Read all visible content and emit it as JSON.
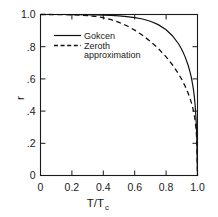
{
  "chart_data": {
    "type": "line",
    "title": "",
    "xlabel": "T/Tc",
    "xlabel_main": "T/T",
    "xlabel_sub": "c",
    "ylabel": "r",
    "xlim": [
      0,
      1.0
    ],
    "ylim": [
      0,
      1.0
    ],
    "grid": false,
    "legend_position": "upper-left-inside",
    "xticks": [
      0,
      0.2,
      0.4,
      0.6,
      0.8,
      1.0
    ],
    "xtick_labels": [
      "0",
      "0.2",
      "0.4",
      "0.6",
      "0.8",
      "1.0"
    ],
    "yticks": [
      0,
      0.2,
      0.4,
      0.6,
      0.8,
      1.0
    ],
    "ytick_labels": [
      "0",
      ".2",
      ".4",
      ".6",
      ".8",
      "1.0"
    ],
    "series": [
      {
        "name": "Gokcen",
        "style": "solid",
        "color": "#111111",
        "x": [
          0.0,
          0.05,
          0.1,
          0.15,
          0.2,
          0.25,
          0.3,
          0.35,
          0.4,
          0.45,
          0.5,
          0.55,
          0.6,
          0.65,
          0.7,
          0.75,
          0.8,
          0.84,
          0.88,
          0.9,
          0.92,
          0.94,
          0.95,
          0.96,
          0.97,
          0.975,
          0.98,
          0.985,
          0.99,
          0.995,
          1.0
        ],
        "values": [
          1.0,
          1.0,
          1.0,
          1.0,
          0.999,
          0.999,
          0.998,
          0.997,
          0.996,
          0.994,
          0.991,
          0.987,
          0.981,
          0.972,
          0.958,
          0.937,
          0.905,
          0.868,
          0.817,
          0.783,
          0.74,
          0.686,
          0.652,
          0.612,
          0.56,
          0.528,
          0.488,
          0.436,
          0.364,
          0.255,
          0.0
        ]
      },
      {
        "name": "Zeroth approximation",
        "style": "dashed",
        "color": "#111111",
        "x": [
          0.0,
          0.05,
          0.1,
          0.15,
          0.2,
          0.25,
          0.3,
          0.35,
          0.4,
          0.45,
          0.5,
          0.55,
          0.6,
          0.65,
          0.7,
          0.75,
          0.8,
          0.84,
          0.88,
          0.9,
          0.92,
          0.94,
          0.95,
          0.96,
          0.97,
          0.975,
          0.98,
          0.985,
          0.99,
          0.995,
          1.0
        ],
        "values": [
          1.0,
          1.0,
          0.999,
          0.999,
          0.998,
          0.996,
          0.993,
          0.988,
          0.98,
          0.968,
          0.951,
          0.93,
          0.903,
          0.871,
          0.833,
          0.789,
          0.737,
          0.688,
          0.63,
          0.596,
          0.557,
          0.512,
          0.486,
          0.456,
          0.42,
          0.398,
          0.372,
          0.34,
          0.296,
          0.229,
          0.0
        ]
      }
    ],
    "legend": [
      {
        "label": "Gokcen",
        "style": "solid"
      },
      {
        "label": "Zeroth",
        "label2": "approximation",
        "style": "dashed"
      }
    ]
  }
}
